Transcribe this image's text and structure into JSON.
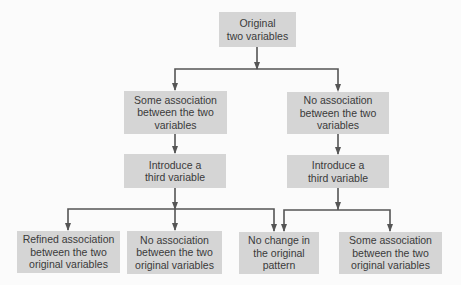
{
  "diagram": {
    "type": "flowchart",
    "root": {
      "lines": [
        "Original",
        "two variables"
      ]
    },
    "level2": [
      {
        "lines": [
          "Some association",
          "between the two",
          "variables"
        ]
      },
      {
        "lines": [
          "No association",
          "between the two",
          "variables"
        ]
      }
    ],
    "level3": [
      {
        "lines": [
          "Introduce a",
          "third variable"
        ]
      },
      {
        "lines": [
          "Introduce a",
          "third variable"
        ]
      }
    ],
    "outcomes": [
      {
        "lines": [
          "Refined association",
          "between the two",
          "original variables"
        ]
      },
      {
        "lines": [
          "No association",
          "between the two",
          "original variables"
        ]
      },
      {
        "lines": [
          "No change in",
          "the original",
          "pattern"
        ]
      },
      {
        "lines": [
          "Some association",
          "between the two",
          "original variables"
        ]
      }
    ],
    "colors": {
      "box_fill": "#d5d5d5",
      "line": "#555555",
      "text": "#3a3a3a",
      "background": "#fbfbfb"
    }
  }
}
